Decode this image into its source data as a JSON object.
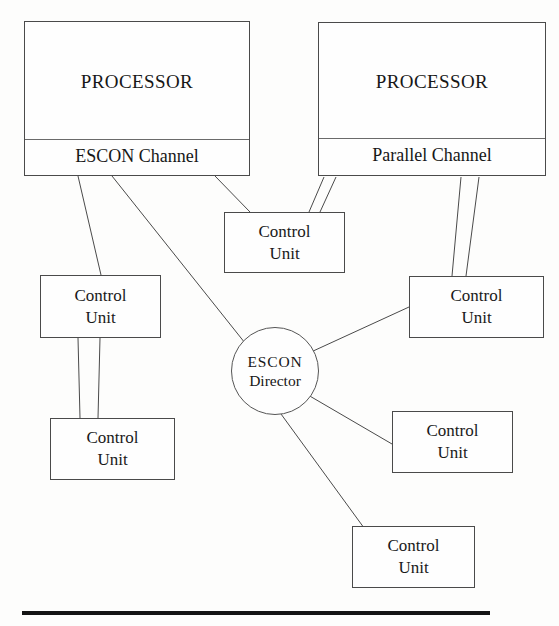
{
  "figure": {
    "type": "block-diagram",
    "background_color": "#fdfdfc",
    "line_color": "#4a4a4a",
    "rule_color": "#141414"
  },
  "processors": [
    {
      "id": "processor-left",
      "title": "PROCESSOR",
      "channel": "ESCON Channel",
      "x": 24,
      "y": 21,
      "w": 226,
      "h": 155,
      "divider_y": 117
    },
    {
      "id": "processor-right",
      "title": "PROCESSOR",
      "channel": "Parallel Channel",
      "x": 318,
      "y": 22,
      "w": 228,
      "h": 154,
      "divider_y": 115
    }
  ],
  "control_units": [
    {
      "id": "cu-top-middle",
      "line1": "Control",
      "line2": "Unit",
      "x": 224,
      "y": 212,
      "w": 121,
      "h": 61
    },
    {
      "id": "cu-left-upper",
      "line1": "Control",
      "line2": "Unit",
      "x": 40,
      "y": 275,
      "w": 121,
      "h": 63
    },
    {
      "id": "cu-left-lower",
      "line1": "Control",
      "line2": "Unit",
      "x": 50,
      "y": 418,
      "w": 125,
      "h": 62
    },
    {
      "id": "cu-right-upper",
      "line1": "Control",
      "line2": "Unit",
      "x": 409,
      "y": 276,
      "w": 135,
      "h": 62
    },
    {
      "id": "cu-right-middle",
      "line1": "Control",
      "line2": "Unit",
      "x": 392,
      "y": 411,
      "w": 121,
      "h": 62
    },
    {
      "id": "cu-bottom",
      "line1": "Control",
      "line2": "Unit",
      "x": 352,
      "y": 526,
      "w": 123,
      "h": 62
    }
  ],
  "director": {
    "id": "escon-director",
    "line1": "ESCON",
    "line2": "Director",
    "cx": 275,
    "cy": 371,
    "r": 44
  },
  "connections": [
    {
      "id": "link-escon-channel-to-cu-left-upper",
      "x1": 78,
      "y1": 176,
      "x2": 101,
      "y2": 275
    },
    {
      "id": "link-escon-channel-to-director",
      "x1": 112,
      "y1": 176,
      "x2": 245,
      "y2": 343
    },
    {
      "id": "link-escon-channel-to-cu-top-middle",
      "x1": 215,
      "y1": 176,
      "x2": 250,
      "y2": 212
    },
    {
      "id": "link-parallel-channel-to-cu-top-middle-a",
      "x1": 324,
      "y1": 177,
      "x2": 309,
      "y2": 212
    },
    {
      "id": "link-parallel-channel-to-cu-top-middle-b",
      "x1": 336,
      "y1": 177,
      "x2": 320,
      "y2": 212
    },
    {
      "id": "link-parallel-channel-to-cu-right-upper-a",
      "x1": 461,
      "y1": 177,
      "x2": 452,
      "y2": 276
    },
    {
      "id": "link-parallel-channel-to-cu-right-upper-b",
      "x1": 479,
      "y1": 177,
      "x2": 466,
      "y2": 276
    },
    {
      "id": "link-cu-left-upper-to-cu-left-lower-a",
      "x1": 78,
      "y1": 338,
      "x2": 80,
      "y2": 418
    },
    {
      "id": "link-cu-left-upper-to-cu-left-lower-b",
      "x1": 100,
      "y1": 338,
      "x2": 98,
      "y2": 418
    },
    {
      "id": "link-director-to-cu-right-upper",
      "x1": 311,
      "y1": 352,
      "x2": 409,
      "y2": 307
    },
    {
      "id": "link-director-to-cu-right-middle",
      "x1": 308,
      "y1": 395,
      "x2": 392,
      "y2": 444
    },
    {
      "id": "link-director-to-cu-bottom",
      "x1": 281,
      "y1": 414,
      "x2": 367,
      "y2": 532
    }
  ],
  "bottom_rule": {
    "id": "footer-rule",
    "x": 22,
    "y": 611,
    "w": 468,
    "h": 4
  }
}
